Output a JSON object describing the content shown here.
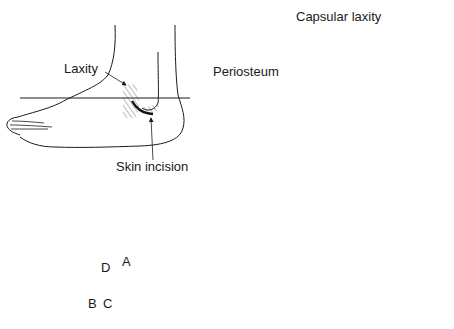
{
  "panels": {
    "top_left": {
      "description": "Lateral view of foot with skin incision and region of laxity",
      "labels": {
        "laxity": "Laxity",
        "skin_incision": "Skin incision"
      }
    },
    "top_right": {
      "description": "Excised ossicle with periosteum and capsular laxity, posterior view of talus/calcaneus",
      "labels": {
        "capsular_laxity": "Capsular laxity",
        "periosteum": "Periosteum"
      }
    },
    "bottom_left": {
      "description": "Lateral view of foot showing incision options A-D",
      "labels": {
        "a": "A",
        "b": "B",
        "c": "C",
        "d": "D"
      }
    },
    "bottom_right": {
      "description": "Lateral view of foot with J-shaped incision and excised ossicle",
      "labels": {}
    }
  },
  "colors": {
    "line": "#1a1a1a",
    "background": "#ffffff",
    "hatch": "#555555"
  }
}
